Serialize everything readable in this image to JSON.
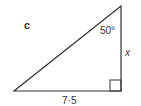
{
  "diagram": {
    "part_label": "c",
    "angle_label": "50°",
    "side_opposite_label": "x",
    "base_label": "7·5",
    "right_angle": true,
    "colors": {
      "stroke": "#333333",
      "text": "#333333",
      "background": "#ffffff"
    }
  }
}
